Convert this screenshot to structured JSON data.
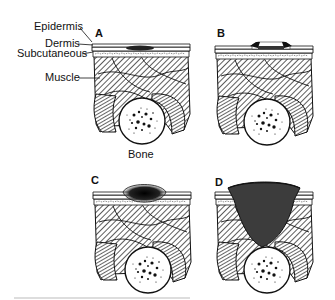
{
  "figure": {
    "labels": {
      "epidermis": "Epidermis",
      "dermis": "Dermis",
      "subcutaneous": "Subcutaneous",
      "muscle": "Muscle",
      "bone": "Bone"
    },
    "panels": [
      {
        "id": "A",
        "label": "A",
        "stage": "intact skin with slight discoloration"
      },
      {
        "id": "B",
        "label": "B",
        "stage": "partial-thickness epidermal/dermal loss"
      },
      {
        "id": "C",
        "label": "C",
        "stage": "full-thickness damage into subcutaneous tissue"
      },
      {
        "id": "D",
        "label": "D",
        "stage": "deep crater extending through muscle to bone"
      }
    ],
    "colors": {
      "ink": "#111111",
      "hatch": "#555555",
      "paper": "#ffffff",
      "wound": "#1a1a1a"
    }
  }
}
